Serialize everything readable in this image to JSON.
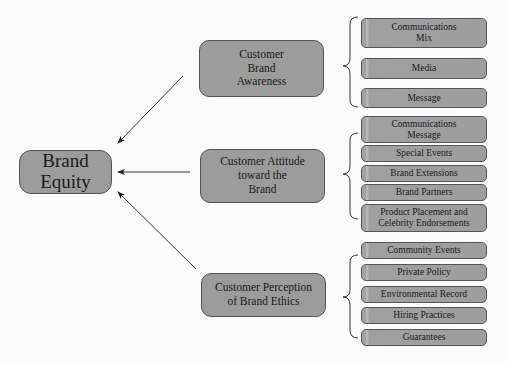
{
  "diagram": {
    "root": {
      "label": "Brand Equity"
    },
    "branches": [
      {
        "label": "Customer Brand Awareness",
        "lines": [
          "Customer",
          "Brand",
          "Awareness"
        ],
        "children": [
          {
            "label": "Communications Mix",
            "lines": [
              "Communications",
              "Mix"
            ]
          },
          {
            "label": "Media",
            "lines": [
              "Media"
            ]
          },
          {
            "label": "Message",
            "lines": [
              "Message"
            ]
          }
        ]
      },
      {
        "label": "Customer Attitude toward the Brand",
        "lines": [
          "Customer Attitude",
          "toward the",
          "Brand"
        ],
        "children": [
          {
            "label": "Communications Message",
            "lines": [
              "Communications",
              "Message"
            ]
          },
          {
            "label": "Special Events",
            "lines": [
              "Special Events"
            ]
          },
          {
            "label": "Brand Extensions",
            "lines": [
              "Brand Extensions"
            ]
          },
          {
            "label": "Brand Partners",
            "lines": [
              "Brand Partners"
            ]
          },
          {
            "label": "Product Placement and Celebrity Endorsements",
            "lines": [
              "Product Placement and",
              "Celebrity Endorsements"
            ]
          }
        ]
      },
      {
        "label": "Customer Perception of Brand Ethics",
        "lines": [
          "Customer Perception",
          "of Brand Ethics"
        ],
        "children": [
          {
            "label": "Community Events",
            "lines": [
              "Community Events"
            ]
          },
          {
            "label": "Private Policy",
            "lines": [
              "Private Policy"
            ]
          },
          {
            "label": "Environmental Record",
            "lines": [
              "Environmental Record"
            ]
          },
          {
            "label": "Hiring Practices",
            "lines": [
              "Hiring Practices"
            ]
          },
          {
            "label": "Guarantees",
            "lines": [
              "Guarantees"
            ]
          }
        ]
      }
    ],
    "colors": {
      "box_fill": "#9c9c9c",
      "box_border": "#555555",
      "line": "#333333",
      "background": "#fbfbfb"
    }
  }
}
